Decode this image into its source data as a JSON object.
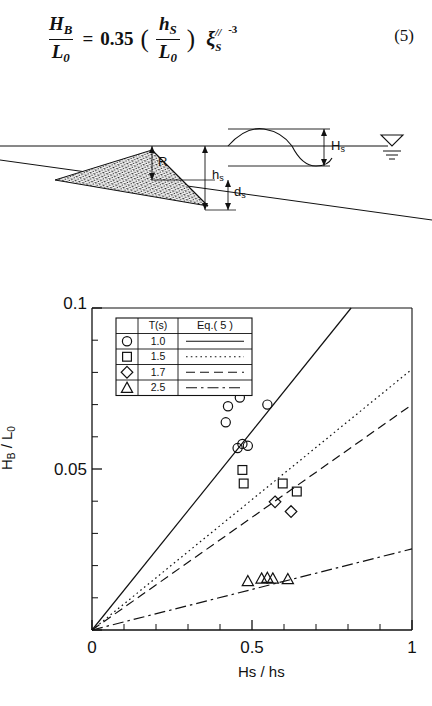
{
  "equation": {
    "label": "Equation 5",
    "lhs_numerator": "H",
    "lhs_numerator_sub": "B",
    "lhs_denominator": "L",
    "lhs_denominator_sub": "0",
    "equals": "=",
    "coefficient": "0.35",
    "paren_open": "(",
    "paren_close": ")",
    "inner_numerator": "h",
    "inner_numerator_sub": "S",
    "inner_denominator": "L",
    "inner_denominator_sub": "0",
    "xi_symbol": "ξ",
    "xi_sub": "S",
    "xi_prime": "//",
    "xi_exponent": "-3",
    "number": "(5)"
  },
  "cross_section": {
    "labels": {
      "runup": "R",
      "berm_depth": "h",
      "berm_depth_sub": "s",
      "crest_depth": "d",
      "crest_depth_sub": "s",
      "wave_height": "H",
      "wave_height_sub": "s"
    },
    "icons": {
      "water_level": "water-level-triangle-icon",
      "wave": "sine-wave-icon",
      "mound": "stippled-berm-icon"
    }
  },
  "chart_data": {
    "type": "scatter",
    "title": "",
    "xlabel": "Hs / hs",
    "ylabel": "HB / L0",
    "xlim": [
      0,
      1
    ],
    "ylim": [
      0,
      0.1
    ],
    "xticks": [
      0,
      0.5,
      1
    ],
    "xtick_labels": [
      "0",
      "0.5",
      "1"
    ],
    "yticks": [
      0,
      0.05,
      0.1
    ],
    "ytick_labels": [
      "0",
      "0.05",
      "0.1"
    ],
    "y_minor_ticks": [
      0.01,
      0.02,
      0.03,
      0.04,
      0.06,
      0.07,
      0.08,
      0.09
    ],
    "x_minor_ticks": [
      0.1,
      0.2,
      0.3,
      0.4,
      0.6,
      0.7,
      0.8,
      0.9
    ],
    "grid": false,
    "legend_position": "upper-left",
    "legend": {
      "header_marker": "",
      "header_period": "T(s)",
      "header_eq": "Eq.( 5 )",
      "rows": [
        {
          "marker": "circle",
          "period": "1.0",
          "line": "solid"
        },
        {
          "marker": "square",
          "period": "1.5",
          "line": "dotted"
        },
        {
          "marker": "diamond",
          "period": "1.7",
          "line": "dashed"
        },
        {
          "marker": "triangle",
          "period": "2.5",
          "line": "dashdot"
        }
      ]
    },
    "series": [
      {
        "name": "T = 1.0 s",
        "marker": "circle",
        "line": "solid",
        "slope": 0.1235,
        "points": [
          [
            0.425,
            0.0695
          ],
          [
            0.455,
            0.0755
          ],
          [
            0.462,
            0.0722
          ],
          [
            0.418,
            0.0645
          ],
          [
            0.548,
            0.07
          ],
          [
            0.455,
            0.0565
          ],
          [
            0.47,
            0.0578
          ],
          [
            0.487,
            0.0572
          ]
        ]
      },
      {
        "name": "T = 1.5 s",
        "marker": "square",
        "line": "dotted",
        "slope": 0.081,
        "points": [
          [
            0.47,
            0.0497
          ],
          [
            0.474,
            0.0455
          ],
          [
            0.596,
            0.0455
          ],
          [
            0.64,
            0.043
          ]
        ]
      },
      {
        "name": "T = 1.7 s",
        "marker": "diamond",
        "line": "dashed",
        "slope": 0.07,
        "points": [
          [
            0.572,
            0.0398
          ],
          [
            0.622,
            0.0368
          ]
        ]
      },
      {
        "name": "T = 2.5 s",
        "marker": "triangle",
        "line": "dashdot",
        "slope": 0.0252,
        "points": [
          [
            0.487,
            0.0152
          ],
          [
            0.53,
            0.016
          ],
          [
            0.548,
            0.0162
          ],
          [
            0.565,
            0.016
          ],
          [
            0.612,
            0.0158
          ]
        ]
      }
    ]
  }
}
